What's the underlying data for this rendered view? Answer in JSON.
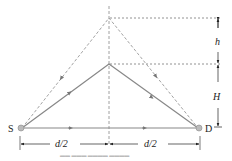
{
  "diagram": {
    "labels": {
      "source": "S",
      "destination": "D",
      "h": "h",
      "H": "H",
      "left_half": "d/2",
      "right_half": "d/2"
    },
    "caption": "Figure (illegible)",
    "colors": {
      "solid_path": "#888888",
      "dashed_path": "#999999",
      "guide_lines": "#777777",
      "dimension": "#333333",
      "node": "#aaaaaa"
    }
  }
}
